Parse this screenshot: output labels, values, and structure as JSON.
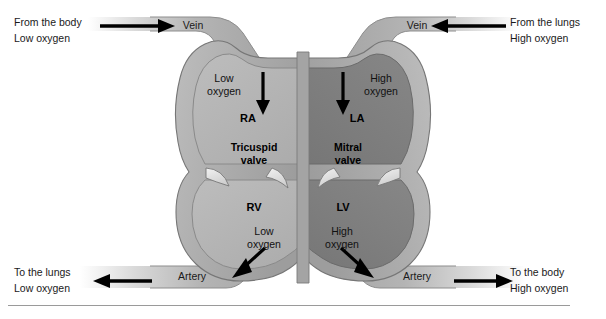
{
  "figure": {
    "divider": "horizontal-rule"
  },
  "colors": {
    "right_side_fill": "#b3b3b3",
    "left_side_fill": "#7d7d7d",
    "wall_fill": "#a8a8a8",
    "vessel_fill": "#b0b0b0",
    "outline": "#6e6e6e",
    "valve_fill": "#e8e8e8",
    "arrow": "#000000",
    "text": "#1a1a1a",
    "rule": "#9a9a9a",
    "background": "#ffffff"
  },
  "labels": {
    "top_left": {
      "line1": "From the body",
      "line2": "Low oxygen"
    },
    "top_right": {
      "line1": "From the lungs",
      "line2": "High oxygen"
    },
    "bottom_left": {
      "line1": "To the lungs",
      "line2": "Low oxygen"
    },
    "bottom_right": {
      "line1": "To the body",
      "line2": "High oxygen"
    }
  },
  "vessels": {
    "top_left_vein": "Vein",
    "top_right_vein": "Vein",
    "bottom_left_artery": "Artery",
    "bottom_right_artery": "Artery"
  },
  "chambers": {
    "right_atrium": "RA",
    "left_atrium": "LA",
    "right_ventricle": "RV",
    "left_ventricle": "LV"
  },
  "valves": {
    "tricuspid": {
      "line1": "Tricuspid",
      "line2": "valve"
    },
    "mitral": {
      "line1": "Mitral",
      "line2": "valve"
    }
  },
  "oxygen_notes": {
    "ra": {
      "line1": "Low",
      "line2": "oxygen"
    },
    "la": {
      "line1": "High",
      "line2": "oxygen"
    },
    "rv": {
      "line1": "Low",
      "line2": "oxygen"
    },
    "lv": {
      "line1": "High",
      "line2": "oxygen"
    }
  }
}
